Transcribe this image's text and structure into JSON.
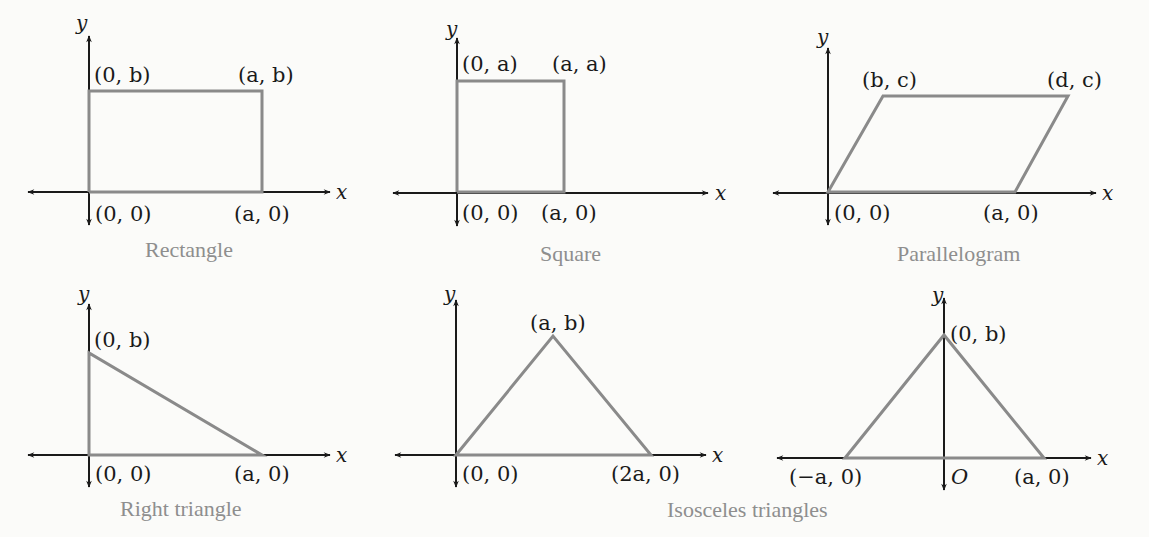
{
  "figures": [
    {
      "id": "rectangle",
      "caption": "Rectangle",
      "axis_labels": {
        "x": "x",
        "y": "y"
      },
      "vertices": [
        {
          "label_pre": "(0, ",
          "label_var": "0",
          "label_post": ")",
          "text": "(0, 0)"
        },
        {
          "text": "(a, 0)"
        },
        {
          "text": "(a, b)"
        },
        {
          "text": "(0, b)"
        }
      ]
    },
    {
      "id": "square",
      "caption": "Square",
      "axis_labels": {
        "x": "x",
        "y": "y"
      },
      "vertices": [
        {
          "text": "(0, 0)"
        },
        {
          "text": "(a, 0)"
        },
        {
          "text": "(a, a)"
        },
        {
          "text": "(0, a)"
        }
      ]
    },
    {
      "id": "parallelogram",
      "caption": "Parallelogram",
      "axis_labels": {
        "x": "x",
        "y": "y"
      },
      "vertices": [
        {
          "text": "(0, 0)"
        },
        {
          "text": "(a, 0)"
        },
        {
          "text": "(d, c)"
        },
        {
          "text": "(b, c)"
        }
      ]
    },
    {
      "id": "right-triangle",
      "caption": "Right triangle",
      "axis_labels": {
        "x": "x",
        "y": "y"
      },
      "vertices": [
        {
          "text": "(0, 0)"
        },
        {
          "text": "(a, 0)"
        },
        {
          "text": "(0, b)"
        }
      ]
    },
    {
      "id": "isosceles-triangle-1",
      "axis_labels": {
        "x": "x",
        "y": "y"
      },
      "vertices": [
        {
          "text": "(0, 0)"
        },
        {
          "text": "(2a, 0)"
        },
        {
          "text": "(a, b)"
        }
      ]
    },
    {
      "id": "isosceles-triangle-2",
      "axis_labels": {
        "x": "x",
        "y": "y"
      },
      "origin_label": "O",
      "vertices": [
        {
          "text": "(−a, 0)"
        },
        {
          "text": "(a, 0)"
        },
        {
          "text": "(0, b)"
        }
      ]
    }
  ],
  "shared_caption": "Isosceles triangles",
  "colors": {
    "axis": "#1a1a1a",
    "shape": "#8a8a8a",
    "caption": "#8e8e8e",
    "background": "#fbfbf9"
  }
}
